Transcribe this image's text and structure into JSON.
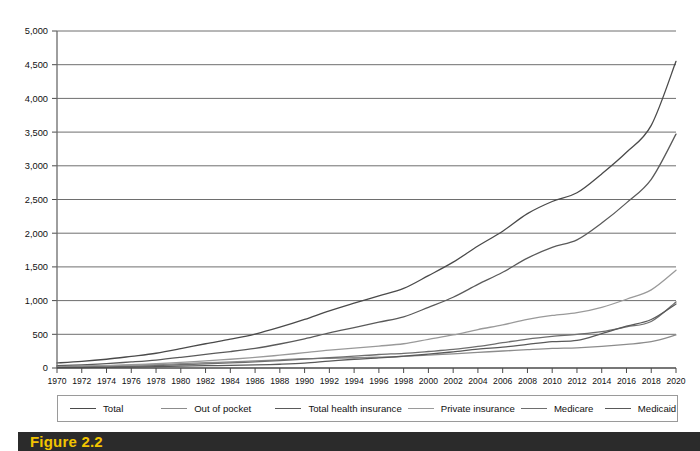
{
  "caption": {
    "label": "Figure 2.2"
  },
  "legend": {
    "position": "bottom",
    "items": [
      {
        "label": "Total",
        "color": "#4a4a4a"
      },
      {
        "label": "Out of pocket",
        "color": "#8c8c8c"
      },
      {
        "label": "Total health insurance",
        "color": "#5a5a5a"
      },
      {
        "label": "Private insurance",
        "color": "#9a9a9a"
      },
      {
        "label": "Medicare",
        "color": "#6e6e6e"
      },
      {
        "label": "Medicaid",
        "color": "#595959"
      }
    ]
  },
  "axes": {
    "y_ticks": [
      "0",
      "500",
      "1,000",
      "1,500",
      "2,000",
      "2,500",
      "3,000",
      "3,500",
      "4,000",
      "4,500",
      "5,000"
    ],
    "x_ticks": [
      "1970",
      "1972",
      "1974",
      "1976",
      "1978",
      "1980",
      "1982",
      "1984",
      "1986",
      "1988",
      "1990",
      "1992",
      "1994",
      "1996",
      "1998",
      "2000",
      "2002",
      "2004",
      "2006",
      "2008",
      "2010",
      "2012",
      "2014",
      "2016",
      "2018",
      "2020"
    ]
  },
  "chart_data": {
    "type": "line",
    "title": "",
    "xlabel": "",
    "ylabel": "",
    "xlim": [
      1970,
      2020
    ],
    "ylim": [
      0,
      5000
    ],
    "ytick_step": 500,
    "xtick_step": 2,
    "grid": true,
    "legend_position": "bottom",
    "x": [
      1970,
      1972,
      1974,
      1976,
      1978,
      1980,
      1982,
      1984,
      1986,
      1988,
      1990,
      1992,
      1994,
      1996,
      1998,
      2000,
      2002,
      2004,
      2006,
      2008,
      2010,
      2012,
      2014,
      2016,
      2018,
      2020
    ],
    "series": [
      {
        "name": "Total",
        "color": "#4a4a4a",
        "values": [
          75,
          98,
          130,
          173,
          219,
          286,
          360,
          427,
          503,
          605,
          721,
          849,
          962,
          1070,
          1180,
          1370,
          1570,
          1810,
          2030,
          2290,
          2470,
          2600,
          2880,
          3200,
          3600,
          4550
        ]
      },
      {
        "name": "Out of pocket",
        "color": "#8c8c8c",
        "values": [
          25,
          30,
          36,
          44,
          52,
          64,
          78,
          91,
          105,
          122,
          138,
          145,
          152,
          160,
          172,
          190,
          210,
          232,
          252,
          272,
          290,
          300,
          320,
          350,
          390,
          490
        ]
      },
      {
        "name": "Total health insurance",
        "color": "#5a5a5a",
        "values": [
          34,
          47,
          66,
          90,
          118,
          158,
          203,
          244,
          292,
          356,
          432,
          520,
          600,
          680,
          760,
          900,
          1050,
          1240,
          1420,
          1630,
          1790,
          1900,
          2150,
          2450,
          2800,
          3470
        ]
      },
      {
        "name": "Private insurance",
        "color": "#9a9a9a",
        "values": [
          20,
          27,
          36,
          49,
          63,
          83,
          107,
          130,
          157,
          190,
          228,
          265,
          295,
          325,
          360,
          425,
          490,
          570,
          640,
          720,
          780,
          820,
          900,
          1020,
          1160,
          1450
        ]
      },
      {
        "name": "Medicare",
        "color": "#6e6e6e",
        "values": [
          9,
          13,
          18,
          25,
          34,
          48,
          62,
          76,
          90,
          110,
          131,
          152,
          175,
          200,
          218,
          245,
          275,
          320,
          375,
          430,
          470,
          500,
          540,
          610,
          690,
          980
        ]
      },
      {
        "name": "Medicaid",
        "color": "#595959",
        "values": [
          5,
          7,
          10,
          14,
          19,
          27,
          34,
          39,
          45,
          56,
          73,
          103,
          130,
          150,
          175,
          205,
          240,
          280,
          310,
          350,
          390,
          410,
          510,
          620,
          720,
          950
        ]
      }
    ]
  }
}
